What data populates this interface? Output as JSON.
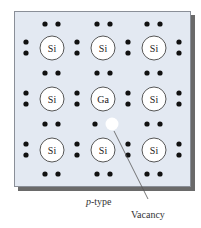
{
  "diagram": {
    "atoms": [
      {
        "row": 0,
        "col": 0,
        "symbol": "Si"
      },
      {
        "row": 0,
        "col": 1,
        "symbol": "Si"
      },
      {
        "row": 0,
        "col": 2,
        "symbol": "Si"
      },
      {
        "row": 1,
        "col": 0,
        "symbol": "Si"
      },
      {
        "row": 1,
        "col": 1,
        "symbol": "Ga"
      },
      {
        "row": 1,
        "col": 2,
        "symbol": "Si"
      },
      {
        "row": 2,
        "col": 0,
        "symbol": "Si"
      },
      {
        "row": 2,
        "col": 1,
        "symbol": "Si"
      },
      {
        "row": 2,
        "col": 2,
        "symbol": "Si"
      }
    ],
    "caption_italic": "p",
    "caption_rest": "-type",
    "vacancy_label": "Vacancy",
    "colors": {
      "panel": "#e3e9f2",
      "electron": "#111111",
      "atom_fill": "#ffffff",
      "vacancy": "#ffffff"
    }
  }
}
